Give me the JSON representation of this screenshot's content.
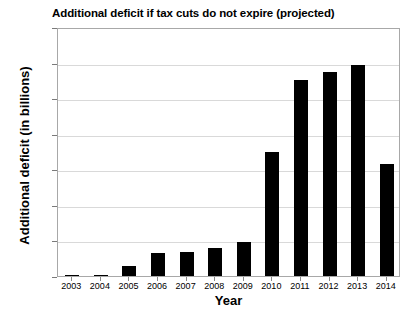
{
  "chart_data": {
    "type": "bar",
    "title": "Additional deficit if tax cuts do not expire (projected)",
    "xlabel": "Year",
    "ylabel": "Additional deficit (in billions)",
    "categories": [
      "2003",
      "2004",
      "2005",
      "2006",
      "2007",
      "2008",
      "2009",
      "2010",
      "2011",
      "2012",
      "2013",
      "2014"
    ],
    "values": [
      0,
      2,
      14,
      33,
      34,
      40,
      48,
      175,
      276,
      287,
      297,
      158
    ],
    "ylim": [
      0,
      350
    ],
    "ytick_values": [
      0,
      50,
      100,
      150,
      200,
      250,
      300,
      350
    ],
    "ytick_labels": [
      "$0",
      "$50",
      "$100",
      "$150",
      "$200",
      "$250",
      "$300",
      "$350"
    ],
    "grid": true,
    "legend": false,
    "bar_color": "#000000",
    "gridline_color": "#d9d9d9",
    "axis_color": "#a8a8a8",
    "background_color": "#ffffff"
  }
}
